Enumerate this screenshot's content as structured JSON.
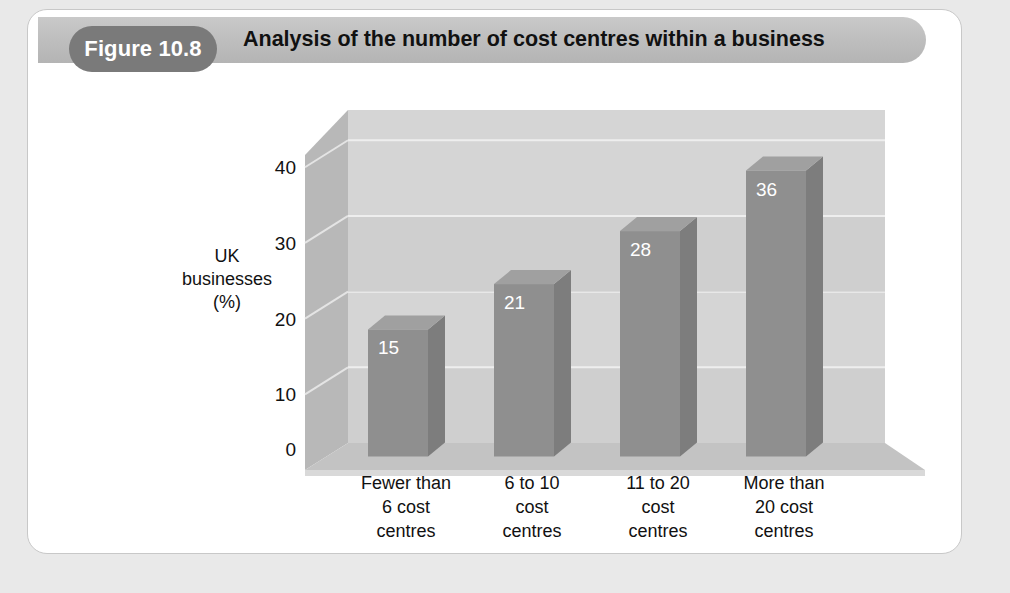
{
  "page": {
    "background_color": "#e9e9e9",
    "card_background": "#ffffff"
  },
  "header": {
    "figure_number": "Figure 10.8",
    "title": "Analysis of the number of cost centres within a business",
    "pill_color": "#7a7a7a",
    "band_color": "#bdbdbd"
  },
  "chart_data": {
    "type": "bar",
    "title": "Analysis of the number of cost centres within a business",
    "subtitle": "",
    "xlabel": "",
    "ylabel": "UK businesses (%)",
    "ylabel_lines": [
      "UK",
      "businesses",
      "(%)"
    ],
    "categories": [
      "Fewer than 6 cost centres",
      "6 to 10 cost centres",
      "11 to 20 cost centres",
      "More than 20 cost centres"
    ],
    "category_lines": [
      [
        "Fewer than",
        "6 cost",
        "centres"
      ],
      [
        "6 to 10",
        "cost",
        "centres"
      ],
      [
        "11 to 20",
        "cost",
        "centres"
      ],
      [
        "More than",
        "20 cost",
        "centres"
      ]
    ],
    "values": [
      15,
      21,
      28,
      36
    ],
    "value_labels": [
      "15",
      "21",
      "28",
      "36"
    ],
    "ylim": [
      0,
      44
    ],
    "yticks": [
      0,
      10,
      20,
      30,
      40
    ],
    "ytick_labels": [
      "0",
      "10",
      "20",
      "30",
      "40"
    ],
    "grid": true,
    "legend": false,
    "three_d": true,
    "bar_face_color": "#8f8f8f",
    "bar_side_color": "#7d7d7d",
    "bar_top_color": "#a0a0a0",
    "wall_color": "#d5d5d5",
    "wall_band_color": "#cfcfcf",
    "floor_color": "#c3c3c3",
    "left_wall_color": "#b8b8b8"
  }
}
